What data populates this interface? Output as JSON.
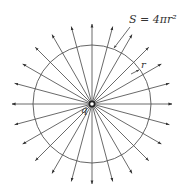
{
  "diagram": {
    "center": {
      "x": 92,
      "y": 104
    },
    "sphere_radius": 59,
    "ray_length": 80,
    "ray_count": 24,
    "ray_angle_step_deg": 15,
    "colors": {
      "line": "#444444",
      "circle": "#555555",
      "text": "#333333",
      "background": "#ffffff"
    },
    "labels": {
      "surface_area": "S = 4πr²",
      "radius": "r",
      "charge": "q"
    }
  }
}
